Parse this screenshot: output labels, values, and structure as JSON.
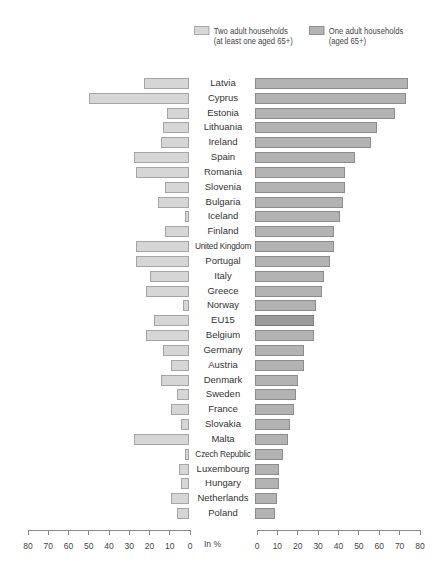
{
  "legend": {
    "two_adult": {
      "line1": "Two adult households",
      "line2": "(at least one aged 65+)",
      "color": "#d6d6d6"
    },
    "one_adult": {
      "line1": "One adult households",
      "line2": "(aged 65+)",
      "color": "#b3b3b3"
    }
  },
  "axis": {
    "unit_label": "In %",
    "left_ticks": [
      "80",
      "70",
      "60",
      "50",
      "40",
      "30",
      "20",
      "10",
      "0"
    ],
    "right_ticks": [
      "0",
      "10",
      "20",
      "30",
      "40",
      "50",
      "60",
      "70",
      "80"
    ]
  },
  "chart_data": {
    "type": "bar",
    "orientation": "horizontal-butterfly",
    "title": "",
    "xlabel": "In %",
    "xlim": [
      0,
      80
    ],
    "legend_position": "top-right",
    "grid": false,
    "categories": [
      "Latvia",
      "Cyprus",
      "Estonia",
      "Lithuania",
      "Ireland",
      "Spain",
      "Romania",
      "Slovenia",
      "Bulgaria",
      "Iceland",
      "Finland",
      "United Kingdom",
      "Portugal",
      "Italy",
      "Greece",
      "Norway",
      "EU15",
      "Belgium",
      "Germany",
      "Austria",
      "Denmark",
      "Sweden",
      "France",
      "Slovakia",
      "Malta",
      "Czech Republic",
      "Luxembourg",
      "Hungary",
      "Netherlands",
      "Poland"
    ],
    "series": [
      {
        "name": "Two adult households (at least one aged 65+)",
        "side": "left",
        "values": [
          22,
          49,
          11,
          13,
          14,
          27,
          26,
          12,
          15,
          2,
          12,
          26,
          26,
          19,
          21,
          3,
          17,
          21,
          13,
          9,
          14,
          6,
          9,
          4,
          27,
          2,
          5,
          4,
          9,
          6
        ]
      },
      {
        "name": "One adult households (aged 65+)",
        "side": "right",
        "values": [
          75,
          74,
          69,
          60,
          57,
          49,
          44,
          44,
          43,
          42,
          39,
          39,
          37,
          34,
          33,
          30,
          29,
          29,
          24,
          24,
          21,
          20,
          19,
          17,
          16,
          14,
          12,
          12,
          11,
          10
        ]
      }
    ],
    "highlight": "EU15"
  }
}
